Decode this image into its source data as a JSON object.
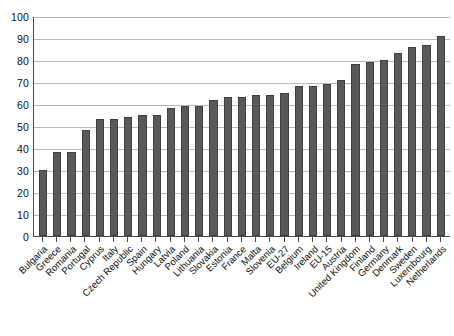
{
  "chart_data": {
    "type": "bar",
    "title": "",
    "xlabel": "",
    "ylabel": "",
    "ylim": [
      0,
      100
    ],
    "ytick_step": 10,
    "grid": true,
    "legend": "none",
    "bar_color": "#595959",
    "categories": [
      "Bulgaria",
      "Greece",
      "Romania",
      "Portugal",
      "Cyprus",
      "Italy",
      "Czech Republic",
      "Spain",
      "Hungary",
      "Latvia",
      "Poland",
      "Lithuania",
      "Slovakia",
      "Estonia",
      "France",
      "Malta",
      "Slovenia",
      "EU-27",
      "Belgium",
      "Ireland",
      "EU-15",
      "Austria",
      "United Kingdom",
      "Finland",
      "Germany",
      "Denmark",
      "Sweden",
      "Luxembourg",
      "Netherlands"
    ],
    "values": [
      30,
      38,
      38,
      48,
      53,
      53,
      54,
      55,
      55,
      58,
      59,
      59,
      62,
      63,
      63,
      64,
      64,
      65,
      68,
      68,
      69,
      71,
      78,
      79,
      80,
      83,
      86,
      87,
      91
    ],
    "ytick_labels": [
      "100",
      "90",
      "80",
      "70",
      "60",
      "50",
      "40",
      "30",
      "20",
      "10",
      "0"
    ]
  }
}
